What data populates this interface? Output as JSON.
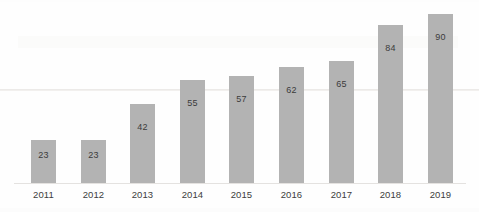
{
  "chart_data": {
    "type": "bar",
    "title": "",
    "subtitle": "",
    "xlabel": "",
    "ylabel": "",
    "categories": [
      "2011",
      "2012",
      "2013",
      "2014",
      "2015",
      "2016",
      "2017",
      "2018",
      "2019"
    ],
    "values": [
      23,
      23,
      42,
      55,
      57,
      62,
      65,
      84,
      90
    ],
    "data_labels": [
      "23",
      "23",
      "42",
      "55",
      "57",
      "62",
      "65",
      "84",
      "90"
    ],
    "series": [
      {
        "name": "",
        "values": [
          23,
          23,
          42,
          55,
          57,
          62,
          65,
          84,
          90
        ]
      }
    ],
    "ylim": [
      0,
      90
    ],
    "grid": false,
    "legend": false,
    "legend_position": "none",
    "bar_color": "#b3b3b3",
    "label_color": "#3b3b3b",
    "axis_label_color": "#3d3d3d",
    "background_color": "#ffffff",
    "baseline_color": "#e4e2e0",
    "annotations": []
  }
}
